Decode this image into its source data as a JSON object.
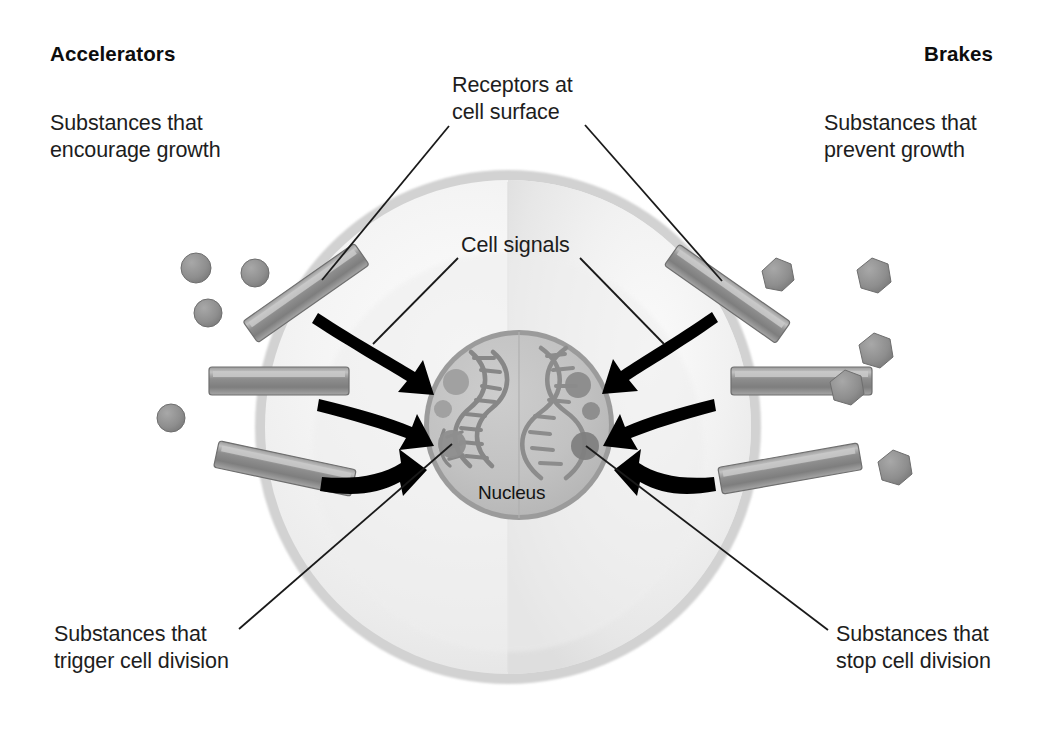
{
  "diagram": {
    "type": "biological-cell-schematic",
    "background_color": "#ffffff"
  },
  "headings": {
    "left": "Accelerators",
    "right": "Brakes"
  },
  "labels": {
    "accelerators_description": "Substances that\nencourage growth",
    "brakes_description": "Substances that\nprevent growth",
    "receptors": "Receptors at\ncell surface",
    "cell_signals": "Cell signals",
    "trigger": "Substances that\ntrigger cell division",
    "stop": "Substances that\nstop cell division",
    "nucleus": "Nucleus"
  },
  "colors": {
    "text": "#1d1d1d",
    "heading": "#0d0d0d",
    "cell_membrane": "#cfcfcf",
    "cytoplasm_light": "#f2f2f2",
    "cytoplasm_shade": "#e3e3e3",
    "nucleus_fill": "#bdbdbd",
    "nucleus_ring": "#8f8f8f",
    "receptor_body": "#8a8a8a",
    "receptor_highlight": "#b5b5b5",
    "particle": "#909090",
    "arrow": "#000000",
    "leader_line": "#1a1a1a",
    "dna": "#8d8d8d"
  },
  "structures": {
    "cell": {
      "cx": 508,
      "cy": 427,
      "rx": 253,
      "ry": 257
    },
    "nucleus": {
      "cx": 519,
      "cy": 425,
      "r": 95
    },
    "receptor_count_left": 3,
    "receptor_count_right": 3,
    "free_particles_left": 3,
    "free_particles_right": 4,
    "arrows_left": 3,
    "arrows_right": 3,
    "dna_strands": 2
  }
}
